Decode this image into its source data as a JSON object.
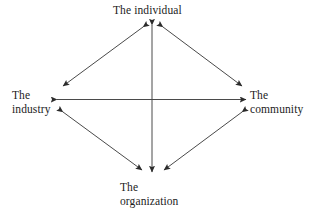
{
  "diagram": {
    "type": "relationship-diamond",
    "background_color": "#ffffff",
    "line_color": "#3a3a3a",
    "text_color": "#1c1c1c",
    "nodes": {
      "top": {
        "id": "individual",
        "lines": [
          "The individual"
        ],
        "line1": "The individual"
      },
      "left": {
        "id": "industry",
        "lines": [
          "The",
          "industry"
        ],
        "line1": "The",
        "line2": "industry"
      },
      "right": {
        "id": "community",
        "lines": [
          "The",
          "community"
        ],
        "line1": "The",
        "line2": "community"
      },
      "bottom": {
        "id": "organization",
        "lines": [
          "The",
          "organization"
        ],
        "line1": "The",
        "line2": "organization"
      }
    },
    "connections": [
      {
        "from": "individual",
        "to": "industry",
        "style": "double-arrow"
      },
      {
        "from": "individual",
        "to": "community",
        "style": "double-arrow"
      },
      {
        "from": "organization",
        "to": "industry",
        "style": "double-arrow"
      },
      {
        "from": "organization",
        "to": "community",
        "style": "double-arrow"
      },
      {
        "from": "industry",
        "to": "community",
        "style": "double-arrow"
      },
      {
        "from": "individual",
        "to": "organization",
        "style": "double-arrow"
      }
    ]
  }
}
